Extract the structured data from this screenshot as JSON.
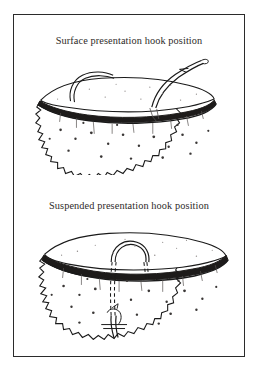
{
  "figure": {
    "background_color": "#ffffff",
    "frame_color": "#2b2b2b",
    "ink_color": "#1a1a1a",
    "caption_color": "#2e2b2a"
  },
  "panels": [
    {
      "id": "surface",
      "caption": "Surface presentation hook position",
      "illustration_name": "sponge-block-surface-hook",
      "elements": {
        "block": "sponge-block",
        "rim_band": "dark-rim-band",
        "hook": "hook-at-surface",
        "thread": "tying-thread",
        "hook_style": "solid"
      }
    },
    {
      "id": "suspended",
      "caption": "Suspended presentation hook position",
      "illustration_name": "sponge-block-suspended-hook",
      "elements": {
        "block": "sponge-block",
        "rim_band": "dark-rim-band",
        "hook": "hook-through-body",
        "thread": "tying-thread",
        "hook_style": "dashed-hidden-line"
      }
    }
  ]
}
